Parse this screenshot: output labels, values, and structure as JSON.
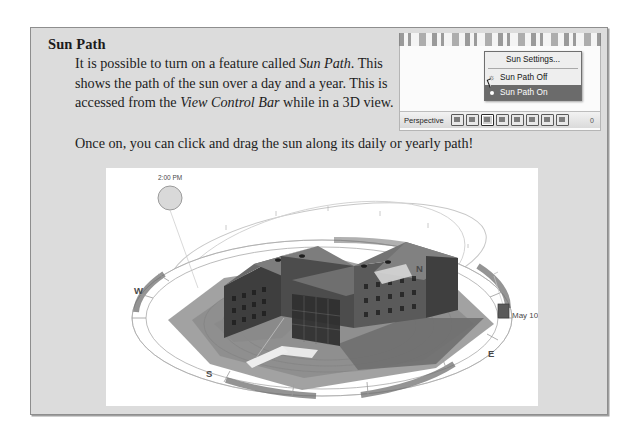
{
  "document": {
    "heading": "Sun Path",
    "paragraph_1_parts": {
      "t1": "It is possible to turn on a feature called ",
      "i1": "Sun Path",
      "t2": ". This shows the path of the sun over a day and a year. This is accessed from the ",
      "i2": "View Control Bar",
      "t3": " while in a 3D view."
    },
    "paragraph_2": "Once on, you can click and drag the sun along its daily or yearly path!"
  },
  "screenshot": {
    "context_menu": {
      "items": [
        {
          "label": "Sun Settings...",
          "icon": "",
          "selected": false
        },
        {
          "label": "Sun Path Off",
          "icon": "sun-path-off-icon",
          "selected": false
        },
        {
          "label": "Sun Path On",
          "icon": "sun-path-on-icon",
          "selected": true
        }
      ]
    },
    "view_control_bar": {
      "mode_label": "Perspective",
      "icons": [
        "scale-icon",
        "detail-level-icon",
        "visual-style-icon",
        "sun-path-icon",
        "shadows-icon",
        "rendering-icon",
        "crop-view-icon",
        "hide-crop-icon"
      ],
      "tail_text": "0"
    },
    "cursor": "mouse-pointer-icon"
  },
  "figure": {
    "sun_time_label": "2:00 PM",
    "date_label": "May 10",
    "compass": {
      "north": "N",
      "south": "S",
      "east": "E",
      "west": "W"
    }
  },
  "colors": {
    "page_background": "#ffffff",
    "panel_background": "#dcdcdc",
    "panel_border": "#8e8e8e",
    "text": "#1d1d1d",
    "menu_highlight": "#6b6b6b",
    "figure_background": "#ffffff"
  }
}
